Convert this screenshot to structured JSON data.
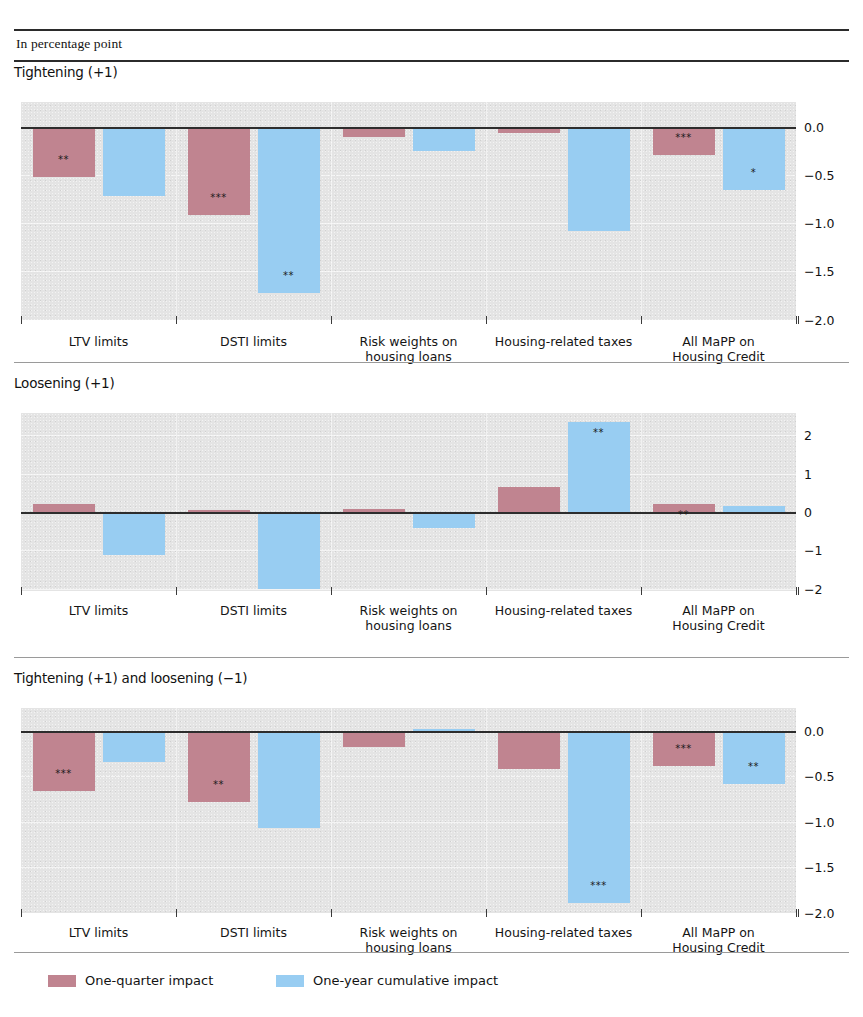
{
  "header": {
    "units_label": "In percentage point"
  },
  "legend": {
    "items": [
      {
        "label": "One-quarter impact",
        "color": "#c08490",
        "key": "one_quarter"
      },
      {
        "label": "One-year cumulative impact",
        "color": "#98cdf2",
        "key": "one_year"
      }
    ]
  },
  "categories": [
    "LTV limits",
    "DSTI limits",
    "Risk weights on\nhousing loans",
    "Housing-related taxes",
    "All MaPP on\nHousing Credit"
  ],
  "chart_data": [
    {
      "type": "bar",
      "title": "Tightening (+1)",
      "xlabel": "",
      "ylabel": "In percentage point",
      "ylim": [
        -2.0,
        0.26
      ],
      "yticks": [
        0.0,
        -0.5,
        -1.0,
        -1.5,
        -2.0
      ],
      "ytick_labels": [
        "0.0",
        "−0.5",
        "−1.0",
        "−1.5",
        "−2.0"
      ],
      "grid": true,
      "legend_position": "bottom",
      "categories": [
        "LTV limits",
        "DSTI limits",
        "Risk weights on\nhousing loans",
        "Housing-related taxes",
        "All MaPP on\nHousing Credit"
      ],
      "series": [
        {
          "name": "One-quarter impact",
          "color": "#c08490",
          "values": [
            -0.52,
            -0.92,
            -0.11,
            -0.07,
            -0.29
          ],
          "significance": [
            "**",
            "***",
            "",
            "",
            "***"
          ]
        },
        {
          "name": "One-year cumulative impact",
          "color": "#98cdf2",
          "values": [
            -0.72,
            -1.73,
            -0.25,
            -1.08,
            -0.66
          ],
          "significance": [
            "",
            "**",
            "",
            "",
            "*"
          ]
        }
      ]
    },
    {
      "type": "bar",
      "title": "Loosening (+1)",
      "xlabel": "",
      "ylabel": "In percentage point",
      "ylim": [
        -2.05,
        2.6
      ],
      "yticks": [
        2,
        1,
        0,
        -1,
        -2
      ],
      "ytick_labels": [
        "2",
        "1",
        "0",
        "−1",
        "−2"
      ],
      "grid": true,
      "legend_position": "bottom",
      "categories": [
        "LTV limits",
        "DSTI limits",
        "Risk weights on\nhousing loans",
        "Housing-related taxes",
        "All MaPP on\nHousing Credit"
      ],
      "series": [
        {
          "name": "One-quarter impact",
          "color": "#c08490",
          "values": [
            0.2,
            0.05,
            0.08,
            0.65,
            0.21
          ],
          "significance": [
            "",
            "",
            "",
            "",
            "**"
          ]
        },
        {
          "name": "One-year cumulative impact",
          "color": "#98cdf2",
          "values": [
            -1.13,
            -2.0,
            -0.42,
            2.35,
            0.15
          ],
          "significance": [
            "",
            "",
            "",
            "**",
            ""
          ]
        }
      ]
    },
    {
      "type": "bar",
      "title": "Tightening (+1) and loosening (−1)",
      "xlabel": "",
      "ylabel": "In percentage point",
      "ylim": [
        -2.0,
        0.26
      ],
      "yticks": [
        0.0,
        -0.5,
        -1.0,
        -1.5,
        -2.0
      ],
      "ytick_labels": [
        "0.0",
        "−0.5",
        "−1.0",
        "−1.5",
        "−2.0"
      ],
      "grid": true,
      "legend_position": "bottom",
      "categories": [
        "LTV limits",
        "DSTI limits",
        "Risk weights on\nhousing loans",
        "Housing-related taxes",
        "All MaPP on\nHousing Credit"
      ],
      "series": [
        {
          "name": "One-quarter impact",
          "color": "#c08490",
          "values": [
            -0.66,
            -0.78,
            -0.18,
            -0.42,
            -0.38
          ],
          "significance": [
            "***",
            "**",
            "",
            "",
            "***"
          ]
        },
        {
          "name": "One-year cumulative impact",
          "color": "#98cdf2",
          "values": [
            -0.34,
            -1.07,
            0.02,
            -1.9,
            -0.58
          ],
          "significance": [
            "",
            "",
            "",
            "***",
            "**"
          ]
        }
      ]
    }
  ]
}
